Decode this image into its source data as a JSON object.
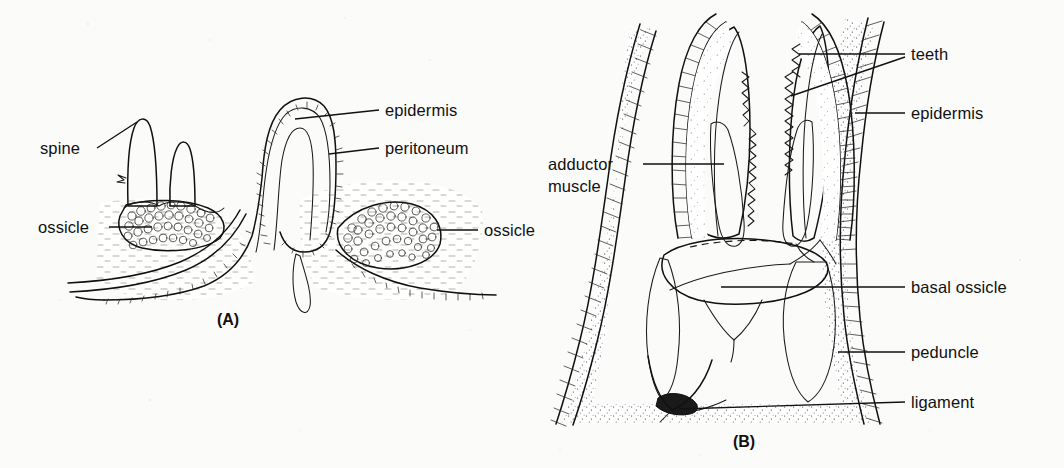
{
  "figure": {
    "background_color": "#fbfbfa",
    "ink_color": "#101010",
    "panels": [
      {
        "id": "A",
        "caption": "(A)",
        "subject": "papula and body wall section",
        "labels": [
          {
            "key": "spine",
            "text": "spine",
            "side": "left"
          },
          {
            "key": "ossicle_l",
            "text": "ossicle",
            "side": "left"
          },
          {
            "key": "epidermis",
            "text": "epidermis",
            "side": "right"
          },
          {
            "key": "peritoneum",
            "text": "peritoneum",
            "side": "right"
          },
          {
            "key": "ossicle_r",
            "text": "ossicle",
            "side": "right"
          }
        ]
      },
      {
        "id": "B",
        "caption": "(B)",
        "subject": "pedicellaria longitudinal section",
        "labels": [
          {
            "key": "adductor_line1",
            "text": "adductor",
            "side": "left"
          },
          {
            "key": "adductor_line2",
            "text": "muscle",
            "side": "left"
          },
          {
            "key": "teeth",
            "text": "teeth",
            "side": "right"
          },
          {
            "key": "epidermis",
            "text": "epidermis",
            "side": "right"
          },
          {
            "key": "basal_ossicle",
            "text": "basal ossicle",
            "side": "right"
          },
          {
            "key": "peduncle",
            "text": "peduncle",
            "side": "right"
          },
          {
            "key": "ligament",
            "text": "ligament",
            "side": "right"
          }
        ]
      }
    ]
  },
  "panel_a": {
    "caption": "(A)",
    "label_spine": "spine",
    "label_ossicle_left": "ossicle",
    "label_epidermis": "epidermis",
    "label_peritoneum": "peritoneum",
    "label_ossicle_right": "ossicle"
  },
  "panel_b": {
    "caption": "(B)",
    "label_adductor_line1": "adductor",
    "label_adductor_line2": "muscle",
    "label_teeth": "teeth",
    "label_epidermis": "epidermis",
    "label_basal_ossicle": "basal ossicle",
    "label_peduncle": "peduncle",
    "label_ligament": "ligament"
  }
}
